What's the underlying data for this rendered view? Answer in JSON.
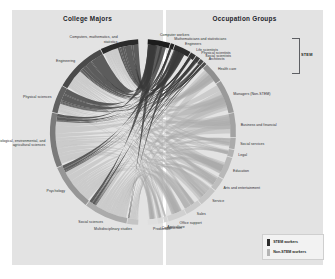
{
  "panels": {
    "left_title": "College Majors",
    "right_title": "Occupation Groups"
  },
  "bracket": {
    "stem_label": "STEM"
  },
  "legend": {
    "items": [
      {
        "label": "STEM workers",
        "color": "#2b2b2b"
      },
      {
        "label": "Non-STEM workers",
        "color": "#b4b4b4"
      }
    ]
  },
  "colors": {
    "panel_bg": "#e3e3e3",
    "page_bg": "#ffffff",
    "stem_ribbon": "#3a3a3a",
    "nonstem_ribbon": "#a9a9a9",
    "arc_dark": "#1c1c1c",
    "arc_mid": "#6e6e6e",
    "arc_light": "#c2c2c2",
    "text": "#2a2c30"
  },
  "chart_data": {
    "type": "chord",
    "left_group_label": "College Majors",
    "right_group_label": "Occupation Groups",
    "left_nodes": [
      {
        "label": "Computers, mathematics, and statistics",
        "stem": true,
        "value": 7.0,
        "arc_color": "#2b2b2b"
      },
      {
        "label": "Engineering",
        "stem": true,
        "value": 9.5,
        "arc_color": "#4a4a4a"
      },
      {
        "label": "Physical sciences",
        "stem": true,
        "value": 5.0,
        "arc_color": "#606060"
      },
      {
        "label": "Biological, environmental, and agricultural sciences",
        "stem": true,
        "value": 10.0,
        "arc_color": "#7a7a7a"
      },
      {
        "label": "Psychology",
        "stem": true,
        "value": 8.5,
        "arc_color": "#969696"
      },
      {
        "label": "Social sciences",
        "stem": true,
        "value": 8.0,
        "arc_color": "#ababab"
      },
      {
        "label": "Multidisciplinary studies",
        "stem": true,
        "value": 2.0,
        "arc_color": "#c4c4c4"
      }
    ],
    "right_nodes": [
      {
        "label": "Computer workers",
        "stem": true,
        "value": 6.0,
        "arc_color": "#1c1c1c"
      },
      {
        "label": "Mathematicians and statisticians",
        "stem": true,
        "value": 1.0,
        "arc_color": "#242424"
      },
      {
        "label": "Engineers",
        "stem": true,
        "value": 4.5,
        "arc_color": "#2c2c2c"
      },
      {
        "label": "Life scientists",
        "stem": true,
        "value": 1.5,
        "arc_color": "#343434"
      },
      {
        "label": "Physical scientists",
        "stem": true,
        "value": 1.2,
        "arc_color": "#3c3c3c"
      },
      {
        "label": "Social scientists",
        "stem": true,
        "value": 1.0,
        "arc_color": "#444444"
      },
      {
        "label": "Architects",
        "stem": true,
        "value": 0.8,
        "arc_color": "#4c4c4c"
      },
      {
        "label": "Health care",
        "stem": false,
        "value": 5.5,
        "arc_color": "#8f8f8f"
      },
      {
        "label": "Managers (Non-STEM)",
        "stem": false,
        "value": 9.0,
        "arc_color": "#9a9a9a"
      },
      {
        "label": "Business and financial",
        "stem": false,
        "value": 6.5,
        "arc_color": "#a3a3a3"
      },
      {
        "label": "Social services",
        "stem": false,
        "value": 3.0,
        "arc_color": "#ababab"
      },
      {
        "label": "Legal",
        "stem": false,
        "value": 2.0,
        "arc_color": "#b2b2b2"
      },
      {
        "label": "Education",
        "stem": false,
        "value": 6.0,
        "arc_color": "#b8b8b8"
      },
      {
        "label": "Arts and entertainment",
        "stem": false,
        "value": 3.5,
        "arc_color": "#bebebe"
      },
      {
        "label": "Service",
        "stem": false,
        "value": 5.0,
        "arc_color": "#c4c4c4"
      },
      {
        "label": "Sales",
        "stem": false,
        "value": 4.5,
        "arc_color": "#cacaca"
      },
      {
        "label": "Office support",
        "stem": false,
        "value": 5.0,
        "arc_color": "#d0d0d0"
      },
      {
        "label": "Agriculture",
        "stem": false,
        "value": 1.0,
        "arc_color": "#d5d5d5"
      },
      {
        "label": "Construction",
        "stem": false,
        "value": 1.5,
        "arc_color": "#dadada"
      },
      {
        "label": "Production",
        "stem": false,
        "value": 2.5,
        "arc_color": "#dfdfdf"
      }
    ],
    "legend_position": "bottom-right",
    "grid": false
  }
}
